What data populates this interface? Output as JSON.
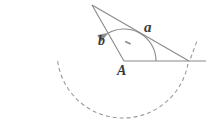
{
  "figure": {
    "kind": "geometry-diagram",
    "background_color": "#ffffff",
    "stroke_color": "#8a8a8a",
    "label_color": "#3a3a3a",
    "dash_color": "#9a9a9a",
    "labels": {
      "side_a": "a",
      "side_b": "b",
      "vertex_A": "A"
    },
    "points": {
      "apex": {
        "x": 92,
        "y": 5
      },
      "vertex_A": {
        "x": 124,
        "y": 61
      },
      "vertex_right": {
        "x": 189,
        "y": 61
      },
      "ray_end": {
        "x": 206,
        "y": 61
      }
    },
    "angle_arc": {
      "center_x": 124,
      "center_y": 61,
      "radius": 32,
      "start_deg": 0,
      "end_deg": 120,
      "has_arrowhead": true
    },
    "dashed_arc": {
      "center_x": 123,
      "center_y": 52,
      "radius": 66,
      "start_deg": 188,
      "end_deg": 352,
      "dash_pattern": "4 3"
    },
    "right_angle_tick": {
      "present": true,
      "x": 128,
      "y": 44
    }
  }
}
